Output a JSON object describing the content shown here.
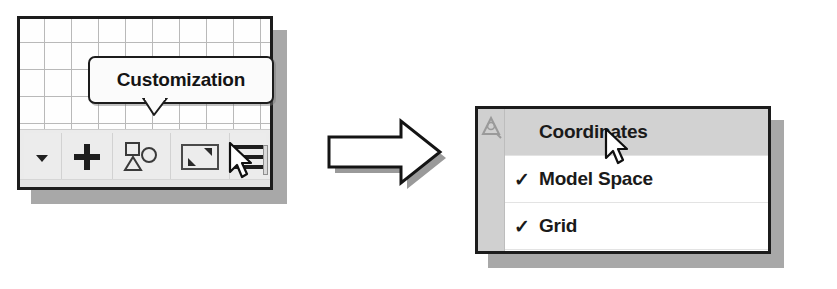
{
  "figure": {
    "background_color": "#ffffff",
    "flow_arrow": "right-arrow"
  },
  "left_panel": {
    "name": "drawing-area-with-status-toolbar",
    "border_color": "#1c1c1c",
    "grid": {
      "visible": true,
      "line_color": "#b9b9b9",
      "cell_size_px": 27
    },
    "tooltip": {
      "label": "Customization",
      "pointer_direction": "down"
    },
    "toolbar": {
      "buttons": [
        {
          "name": "dropdown-arrow-button",
          "icon": "chevron-down-icon",
          "label": ""
        },
        {
          "name": "add-button",
          "icon": "plus-icon",
          "label": ""
        },
        {
          "name": "shapes-button",
          "icon": "shapes-icon",
          "label": ""
        },
        {
          "name": "zoom-extents-button",
          "icon": "zoom-extents-icon",
          "label": ""
        },
        {
          "name": "customization-menu-button",
          "icon": "hamburger-menu-icon",
          "label": ""
        }
      ]
    },
    "cursor": {
      "visible": true,
      "over": "customization-menu-button"
    }
  },
  "right_panel": {
    "name": "customization-menu",
    "border_color": "#1c1c1c",
    "gutter": {
      "visible": true,
      "icon": "ucs-triangle-icon",
      "color": "#d0d0d0"
    },
    "highlight_color": "#d2d2d2",
    "check_glyph": "✓",
    "items": [
      {
        "label": "Coordinates",
        "checked": false,
        "highlighted": true
      },
      {
        "label": "Model Space",
        "checked": true,
        "highlighted": false
      },
      {
        "label": "Grid",
        "checked": true,
        "highlighted": false
      }
    ],
    "cursor": {
      "visible": true,
      "over": "Coordinates"
    }
  }
}
